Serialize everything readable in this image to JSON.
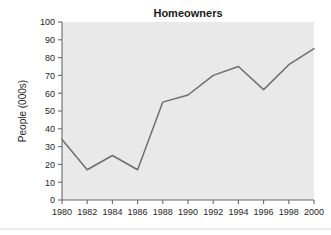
{
  "chart_data": {
    "type": "line",
    "title": "Homeowners",
    "xlabel": "",
    "ylabel": "People (000s)",
    "x": [
      1980,
      1982,
      1984,
      1986,
      1988,
      1990,
      1992,
      1994,
      1996,
      1998,
      2000
    ],
    "values": [
      34,
      17,
      25,
      17,
      55,
      59,
      70,
      75,
      62,
      76,
      85
    ],
    "series": [
      {
        "name": "Homeowners",
        "values": [
          34,
          17,
          25,
          17,
          55,
          59,
          70,
          75,
          62,
          76,
          85
        ]
      }
    ],
    "xlim": [
      1980,
      2000
    ],
    "ylim": [
      0,
      100
    ],
    "xticks": [
      1980,
      1982,
      1984,
      1986,
      1988,
      1990,
      1992,
      1994,
      1996,
      1998,
      2000
    ],
    "xtick_labels": [
      "1980",
      "1982",
      "1984",
      "1986",
      "1988",
      "1990",
      "1992",
      "1994",
      "1996",
      "1998",
      "2000"
    ],
    "yticks": [
      0,
      10,
      20,
      30,
      40,
      50,
      60,
      70,
      80,
      90,
      100
    ],
    "ytick_labels": [
      "0",
      "10",
      "20",
      "30",
      "40",
      "50",
      "60",
      "70",
      "80",
      "90",
      "100"
    ],
    "grid": false,
    "legend": false,
    "legend_position": "none",
    "line_color": "#6e6e6e",
    "plot_background_color": "#e9e9e9",
    "figure_background_color": "#ffffff",
    "axis_color": "#6b6b6b"
  }
}
